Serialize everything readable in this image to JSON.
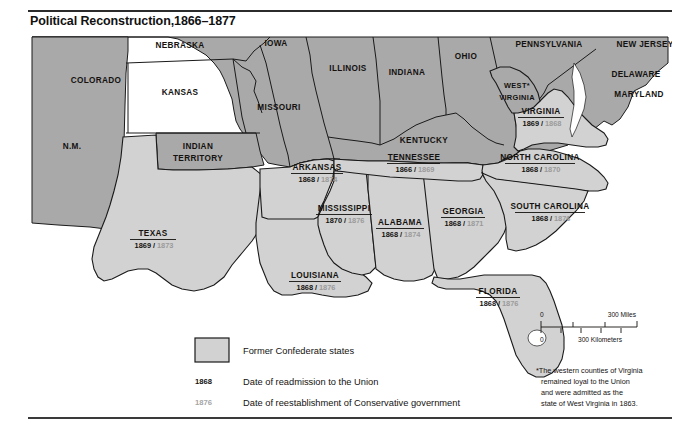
{
  "page": {
    "title": "Political Reconstruction,1866–1877"
  },
  "map": {
    "non_confederate_states": [
      {
        "id": "colorado",
        "label": "COLORADO",
        "x": 68,
        "y": 50
      },
      {
        "id": "nebraska",
        "label": "NEBRASKA",
        "x": 152,
        "y": 15
      },
      {
        "id": "iowa",
        "label": "IOWA",
        "x": 248,
        "y": 13
      },
      {
        "id": "kansas",
        "label": "KANSAS",
        "x": 152,
        "y": 62
      },
      {
        "id": "new-mexico",
        "label": "N.M.",
        "x": 44,
        "y": 116
      },
      {
        "id": "indian-territory",
        "label": "INDIAN",
        "x": 170,
        "y": 116
      },
      {
        "id": "indian-territory-2",
        "label": "TERRITORY",
        "x": 170,
        "y": 128
      },
      {
        "id": "missouri",
        "label": "MISSOURI",
        "x": 251,
        "y": 77
      },
      {
        "id": "illinois",
        "label": "ILLINOIS",
        "x": 320,
        "y": 38
      },
      {
        "id": "indiana",
        "label": "INDIANA",
        "x": 379,
        "y": 42
      },
      {
        "id": "ohio",
        "label": "OHIO",
        "x": 438,
        "y": 26
      },
      {
        "id": "kentucky",
        "label": "KENTUCKY",
        "x": 396,
        "y": 110
      },
      {
        "id": "pennsylvania",
        "label": "PENNSYLVANIA",
        "x": 521,
        "y": 14
      },
      {
        "id": "new-jersey",
        "label": "NEW JERSEY",
        "x": 617,
        "y": 14
      },
      {
        "id": "west-virginia",
        "label": "WEST*",
        "x": 489,
        "y": 55
      },
      {
        "id": "west-virginia-2",
        "label": "VIRGINIA",
        "x": 489,
        "y": 67
      },
      {
        "id": "delaware",
        "label": "DELAWARE",
        "x": 608,
        "y": 44
      },
      {
        "id": "maryland",
        "label": "MARYLAND",
        "x": 611,
        "y": 64
      }
    ],
    "confederate_states": [
      {
        "id": "virginia",
        "label": "VIRGINIA",
        "admitted": "1869",
        "conservative": "1868",
        "x": 513,
        "y": 81,
        "underline_w": 46
      },
      {
        "id": "north-carolina",
        "label": "NORTH CAROLINA",
        "admitted": "1868",
        "conservative": "1870",
        "x": 512,
        "y": 127,
        "underline_w": 70
      },
      {
        "id": "south-carolina",
        "label": "SOUTH CAROLINA",
        "admitted": "1868",
        "conservative": "1876",
        "x": 522,
        "y": 176,
        "underline_w": 70
      },
      {
        "id": "tennessee",
        "label": "TENNESSEE",
        "admitted": "1866",
        "conservative": "1869",
        "x": 386,
        "y": 127,
        "underline_w": 53
      },
      {
        "id": "arkansas",
        "label": "ARKANSAS",
        "admitted": "1868",
        "conservative": "1874",
        "x": 289,
        "y": 137,
        "underline_w": 52
      },
      {
        "id": "mississippi",
        "label": "MISSISSIPPI",
        "admitted": "1870",
        "conservative": "1876",
        "x": 316,
        "y": 178,
        "underline_w": 56
      },
      {
        "id": "alabama",
        "label": "ALABAMA",
        "admitted": "1868",
        "conservative": "1874",
        "x": 372,
        "y": 192,
        "underline_w": 48
      },
      {
        "id": "georgia",
        "label": "GEORGIA",
        "admitted": "1868",
        "conservative": "1871",
        "x": 435,
        "y": 181,
        "underline_w": 44
      },
      {
        "id": "louisiana",
        "label": "LOUISIANA",
        "admitted": "1868",
        "conservative": "1876",
        "x": 287,
        "y": 245,
        "underline_w": 52
      },
      {
        "id": "texas",
        "label": "TEXAS",
        "admitted": "1869",
        "conservative": "1873",
        "x": 125,
        "y": 203,
        "underline_w": 46
      },
      {
        "id": "florida",
        "label": "FLORIDA",
        "admitted": "1868",
        "conservative": "1876",
        "x": 470,
        "y": 261,
        "underline_w": 44
      }
    ]
  },
  "legend": {
    "swatch_label": "Former Confederate states",
    "admit_key": "1868",
    "admit_label": "Date of readmission to the Union",
    "conserv_key": "1876",
    "conserv_label": "Date of reestablishment of Conservative government"
  },
  "scale": {
    "miles_zero": "0",
    "miles_max": "300 Miles",
    "km_zero": "0",
    "km_max": "300 Kilometers"
  },
  "footnote": {
    "line1": "*The western counties of Virginia",
    "line2": "remained loyal to the Union",
    "line3": "and were admitted as the",
    "line4": "state of West Virginia in 1863."
  },
  "colors": {
    "union_fill": "#a9a9a9",
    "confederate_fill": "#d2d2d2",
    "ocean": "#ffffff",
    "border": "#1a1a1a",
    "conservative_date": "#9a9a9a"
  }
}
